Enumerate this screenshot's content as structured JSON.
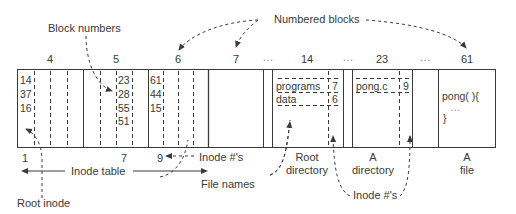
{
  "diagram": {
    "callouts": {
      "block_numbers": "Block numbers",
      "numbered_blocks": "Numbered blocks",
      "inode_numbers_bottom": "Inode #'s",
      "inode_numbers_inline": "Inode #'s",
      "file_names": "File names",
      "root_inode": "Root inode",
      "inode_table": "Inode table"
    },
    "block_labels": [
      {
        "id": "4",
        "x": 50
      },
      {
        "id": "5",
        "x": 116
      },
      {
        "id": "6",
        "x": 178
      },
      {
        "id": "7",
        "x": 236
      },
      {
        "id": "…",
        "x": 268
      },
      {
        "id": "14",
        "x": 307
      },
      {
        "id": "…",
        "x": 348
      },
      {
        "id": "23",
        "x": 382
      },
      {
        "id": "…",
        "x": 425
      },
      {
        "id": "61",
        "x": 467
      }
    ],
    "inode_blocks": [
      {
        "block": "4",
        "values": [
          "14",
          "37",
          "16"
        ]
      },
      {
        "block": "5",
        "values": [
          "23",
          "28",
          "55",
          "51"
        ]
      },
      {
        "block": "6",
        "values": [
          "61",
          "44",
          "15"
        ]
      }
    ],
    "inode_index_labels": [
      {
        "label": "1",
        "x": 25
      },
      {
        "label": "7",
        "x": 124
      },
      {
        "label": "9",
        "x": 160
      }
    ],
    "root_directory": {
      "block": "14",
      "entries": [
        {
          "name": "programs",
          "inode": "7"
        },
        {
          "name": "data",
          "inode": "6"
        }
      ],
      "caption_line1": "Root",
      "caption_line2": "directory"
    },
    "a_directory": {
      "block": "23",
      "entries": [
        {
          "name": "pong.c",
          "inode": "9"
        }
      ],
      "caption_line1": "A",
      "caption_line2": "directory"
    },
    "a_file": {
      "block": "61",
      "content_line1": "pong( ){",
      "content_line2": "…",
      "content_line3": "}",
      "caption_line1": "A",
      "caption_line2": "file"
    }
  }
}
